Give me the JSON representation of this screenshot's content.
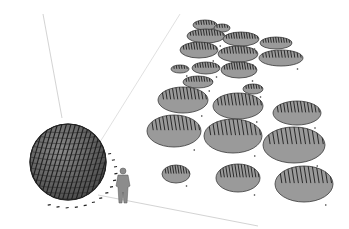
{
  "scene": {
    "description": "3D model viewport: faceted hatched sphere beside a human scale figure and a field of hatched elliptical discs on a ground plane",
    "colors": {
      "background": "#ffffff",
      "disc_fill": "#9a9a9a",
      "disc_stroke": "#3a3a3a",
      "hatch": "#2a2a2a",
      "axis_line": "#c8c8c8",
      "sphere_fill": "#6a6a6a",
      "figure_fill": "#8a8a8a"
    },
    "icons": [
      "sphere-model",
      "human-scale-figure",
      "disc-array"
    ],
    "discs": [
      {
        "cx": 205,
        "cy": 25,
        "rx": 12,
        "ry": 5
      },
      {
        "cx": 222,
        "cy": 28,
        "rx": 8,
        "ry": 4
      },
      {
        "cx": 206,
        "cy": 36,
        "rx": 19,
        "ry": 7
      },
      {
        "cx": 241,
        "cy": 39,
        "rx": 18,
        "ry": 7
      },
      {
        "cx": 276,
        "cy": 43,
        "rx": 16,
        "ry": 6
      },
      {
        "cx": 199,
        "cy": 50,
        "rx": 19,
        "ry": 8
      },
      {
        "cx": 238,
        "cy": 54,
        "rx": 20,
        "ry": 8
      },
      {
        "cx": 281,
        "cy": 58,
        "rx": 22,
        "ry": 8
      },
      {
        "cx": 180,
        "cy": 69,
        "rx": 9,
        "ry": 4
      },
      {
        "cx": 206,
        "cy": 68,
        "rx": 14,
        "ry": 6
      },
      {
        "cx": 239,
        "cy": 70,
        "rx": 18,
        "ry": 8
      },
      {
        "cx": 198,
        "cy": 82,
        "rx": 15,
        "ry": 6
      },
      {
        "cx": 183,
        "cy": 100,
        "rx": 25,
        "ry": 13
      },
      {
        "cx": 238,
        "cy": 106,
        "rx": 25,
        "ry": 13
      },
      {
        "cx": 253,
        "cy": 89,
        "rx": 10,
        "ry": 5
      },
      {
        "cx": 297,
        "cy": 113,
        "rx": 24,
        "ry": 12
      },
      {
        "cx": 174,
        "cy": 131,
        "rx": 27,
        "ry": 16
      },
      {
        "cx": 233,
        "cy": 136,
        "rx": 29,
        "ry": 17
      },
      {
        "cx": 294,
        "cy": 145,
        "rx": 31,
        "ry": 18
      },
      {
        "cx": 176,
        "cy": 174,
        "rx": 14,
        "ry": 9
      },
      {
        "cx": 238,
        "cy": 178,
        "rx": 22,
        "ry": 14
      },
      {
        "cx": 304,
        "cy": 184,
        "rx": 29,
        "ry": 18
      }
    ]
  }
}
